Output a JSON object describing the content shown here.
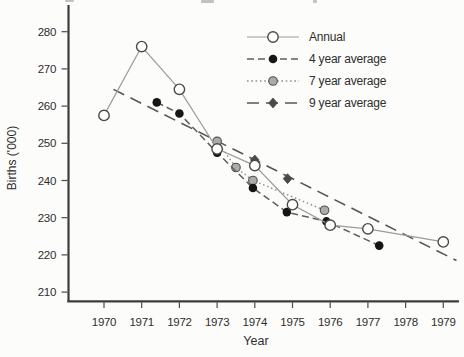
{
  "chart_data": {
    "type": "line",
    "title": "",
    "xlabel": "Year",
    "ylabel": "Births ('000)",
    "x_ticks": [
      1970,
      1971,
      1972,
      1973,
      1974,
      1975,
      1976,
      1977,
      1978,
      1979
    ],
    "y_ticks": [
      210,
      220,
      230,
      240,
      250,
      260,
      270,
      280
    ],
    "xlim": [
      1969,
      1979.7
    ],
    "ylim": [
      207,
      283
    ],
    "grid": false,
    "legend_position": "upper-right",
    "series": [
      {
        "name": "Annual",
        "line_style": "solid",
        "marker": "open-circle",
        "color": "#9b9b9b",
        "x": [
          1970,
          1971,
          1972,
          1973,
          1974,
          1975,
          1976,
          1977,
          1979
        ],
        "y": [
          257.5,
          276,
          264.5,
          248.5,
          244,
          233.5,
          228,
          227,
          223.5
        ]
      },
      {
        "name": "4 year average",
        "line_style": "dashed",
        "marker": "filled-circle",
        "color": "#5e5e5e",
        "x": [
          1971.4,
          1972,
          1973,
          1973.95,
          1974.85,
          1975.9,
          1977.3
        ],
        "y": [
          261,
          258,
          247.5,
          238,
          231.5,
          229,
          222.5
        ]
      },
      {
        "name": "7 year average",
        "line_style": "dotted",
        "marker": "gray-circle",
        "color": "#8e8e8e",
        "x": [
          1973,
          1973.5,
          1973.95,
          1975.85
        ],
        "y": [
          250.5,
          243.5,
          240,
          232
        ]
      },
      {
        "name": "9 year average",
        "line_style": "long-dash",
        "marker": "dark-diamond",
        "color": "#565656",
        "x": [
          1974,
          1974.87
        ],
        "y": [
          245.5,
          240.5
        ],
        "trend_line": {
          "x": [
            1970.25,
            1979.35
          ],
          "y": [
            264.5,
            218.5
          ]
        }
      }
    ]
  }
}
